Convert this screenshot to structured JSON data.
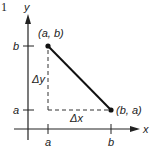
{
  "figure": {
    "number": "1",
    "axes": {
      "x_label": "x",
      "y_label": "y"
    },
    "ticks": {
      "x": [
        {
          "label": "a"
        },
        {
          "label": "b"
        }
      ],
      "y": [
        {
          "label": "b"
        },
        {
          "label": "a"
        }
      ]
    },
    "points": [
      {
        "label": "(a, b)"
      },
      {
        "label": "(b, a)"
      }
    ],
    "deltas": {
      "dx": "Δx",
      "dy": "Δy"
    },
    "colors": {
      "ink": "#222222"
    }
  }
}
